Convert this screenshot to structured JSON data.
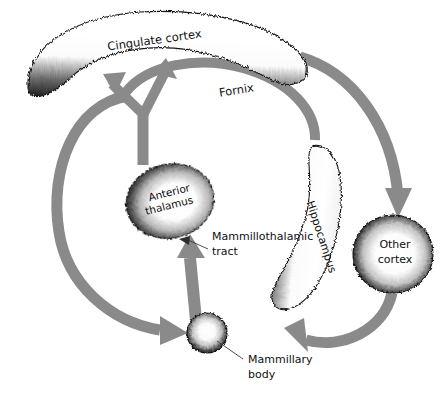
{
  "figure": {
    "type": "anatomical-circuit-diagram",
    "background_color": "#ffffff",
    "arrow_color": "#8a8a8a",
    "structure_outline_color": "#1a1a1a",
    "structure_fill_color": "#ffffff",
    "label_color": "#101010",
    "leader_line_color": "#444444"
  },
  "structures": [
    {
      "id": "cingulate-cortex",
      "label": "Cingulate cortex",
      "shape": "curved-band",
      "label_rotation_deg": -8,
      "label_x": 155,
      "label_y": 44
    },
    {
      "id": "anterior-thalamus",
      "label_line1": "Anterior",
      "label_line2": "thalamus",
      "shape": "oval",
      "label_rotation_deg": -14,
      "label_x": 170,
      "label_y": 196,
      "center_x": 170,
      "center_y": 201,
      "rx": 44,
      "ry": 37
    },
    {
      "id": "hippocampus",
      "label": "Hippocampus",
      "shape": "curved-band",
      "label_rotation_deg": 72,
      "label_x": 318,
      "label_y": 238
    },
    {
      "id": "other-cortex",
      "label_line1": "Other",
      "label_line2": "cortex",
      "shape": "circle",
      "label_rotation_deg": 0,
      "label_x": 395,
      "label_y": 248,
      "center_x": 393,
      "center_y": 254,
      "rx": 40,
      "ry": 39
    },
    {
      "id": "mammillary-body",
      "label_line1": "Mammillary",
      "label_line2": "body",
      "shape": "small-sphere",
      "label_rotation_deg": 0,
      "label_x": 248,
      "label_y": 363,
      "center_x": 207,
      "center_y": 333,
      "rx": 20,
      "ry": 20
    }
  ],
  "pathways": [
    {
      "id": "fornix",
      "label": "Fornix",
      "label_rotation_deg": -9,
      "label_x": 237,
      "label_y": 94,
      "from": "hippocampus",
      "to": "cingulate-cortex / mammillary body",
      "has_arrowhead": true
    },
    {
      "id": "mammillothalamic-tract",
      "label_line1": "Mammillothalamic",
      "label_line2": "tract",
      "label_rotation_deg": 0,
      "label_x": 212,
      "label_y": 240,
      "from": "mammillary-body",
      "to": "anterior-thalamus",
      "has_arrowhead": true
    },
    {
      "id": "thalamus-to-cingulate",
      "from": "anterior-thalamus",
      "to": "cingulate-cortex",
      "has_arrowhead": true,
      "shape": "forked-Y"
    },
    {
      "id": "cingulate-to-other-cortex",
      "from": "cingulate-cortex",
      "to": "other-cortex",
      "has_arrowhead": true
    },
    {
      "id": "other-cortex-to-hippocampus",
      "from": "other-cortex",
      "to": "hippocampus",
      "has_arrowhead": true
    },
    {
      "id": "cingulate-to-mammillary",
      "from": "cingulate-cortex",
      "to": "mammillary-body",
      "has_arrowhead": true
    }
  ]
}
